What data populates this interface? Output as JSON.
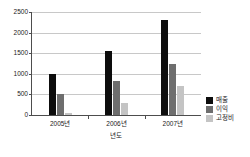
{
  "chart_data": {
    "type": "bar",
    "title": "",
    "xlabel": "년도",
    "ylabel": "",
    "categories": [
      "2005년",
      "2006년",
      "2007년"
    ],
    "series": [
      {
        "name": "매출",
        "color": "#0d0d0d",
        "values": [
          1000,
          1550,
          2300
        ]
      },
      {
        "name": "이익",
        "color": "#6e6e6e",
        "values": [
          500,
          830,
          1250
        ]
      },
      {
        "name": "고정비",
        "color": "#c4c4c4",
        "values": [
          60,
          290,
          700
        ]
      }
    ],
    "ylim": [
      0,
      2500
    ],
    "yticks": [
      0,
      500,
      1000,
      1500,
      2000,
      2500
    ],
    "ytick_labels": [
      "0",
      "500",
      "1000",
      "1500",
      "2000",
      "2500"
    ],
    "grid": true,
    "legend_position": "right"
  },
  "axes": {
    "y_tick_labels": [
      "2500",
      "2000",
      "1500",
      "1000",
      "500",
      "0"
    ],
    "x_tick_labels": [
      "2005년",
      "2006년",
      "2007년"
    ],
    "x_title": "년도"
  },
  "legend": {
    "items": [
      {
        "label": "매출",
        "color": "#0d0d0d"
      },
      {
        "label": "이익",
        "color": "#6e6e6e"
      },
      {
        "label": "고정비",
        "color": "#c4c4c4"
      }
    ]
  }
}
